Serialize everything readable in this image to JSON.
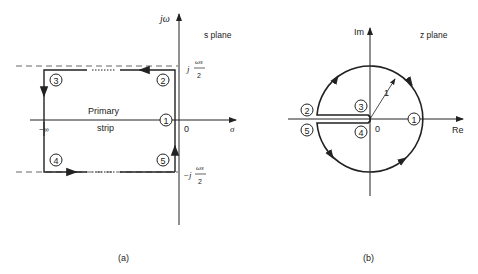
{
  "panel_a": {
    "caption": "(a)",
    "plane_label": "s plane",
    "axis_vertical": "jω",
    "axis_horizontal": "σ",
    "origin": "0",
    "neg_infinity": "−∞",
    "region_label_1": "Primary",
    "region_label_2": "strip",
    "top_limit_j": "j",
    "top_limit_num": "ωs",
    "top_limit_den": "2",
    "bottom_limit_j": "−j",
    "bottom_limit_num": "ωs",
    "bottom_limit_den": "2",
    "points": [
      "1",
      "2",
      "3",
      "4",
      "5"
    ]
  },
  "panel_b": {
    "caption": "(b)",
    "plane_label": "z plane",
    "axis_vertical": "Im",
    "axis_horizontal": "Re",
    "origin": "0",
    "radius_label": "1",
    "points": [
      "1",
      "2",
      "3",
      "4",
      "5"
    ]
  },
  "colors": {
    "line": "#222222",
    "dashed": "#555555"
  }
}
